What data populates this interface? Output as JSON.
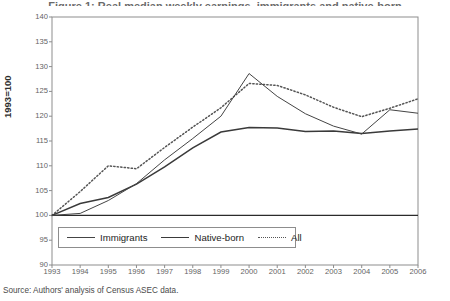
{
  "title_sliver": "Figure 1: Real median weekly earnings, immigrants and native-born",
  "source_note": "Source: Authors' analysis of Census ASEC data.",
  "legend": {
    "position": "inside-bottom-left",
    "entries": [
      {
        "label": "Immigrants",
        "style": "solid-thin",
        "swatch": "line-swatch-immigrants"
      },
      {
        "label": "Native-born",
        "style": "solid-thick",
        "swatch": "line-swatch-native-born"
      },
      {
        "label": "All",
        "style": "dotted",
        "swatch": "line-swatch-all"
      }
    ]
  },
  "axes": {
    "y_title": "1993=100",
    "y_ticks": [
      90,
      95,
      100,
      105,
      110,
      115,
      120,
      125,
      130,
      135,
      140
    ],
    "x_ticks": [
      1993,
      1994,
      1995,
      1996,
      1997,
      1998,
      1999,
      2000,
      2001,
      2002,
      2003,
      2004,
      2005,
      2006
    ]
  },
  "colors": {
    "immigrants": "#444444",
    "native_born": "#3a3a3a",
    "all": "#555555",
    "frame": "#8d8d8d",
    "baseline": "#2b2b2b",
    "text": "#3a3a3a",
    "tick_text": "#636363"
  },
  "chart_data": {
    "type": "line",
    "title": "Figure 1: Real median weekly earnings, immigrants and native-born",
    "subtitle": "",
    "xlabel": "",
    "ylabel": "1993=100",
    "xlim": [
      1993,
      2006
    ],
    "ylim": [
      90,
      140
    ],
    "ytick_step": 5,
    "grid": false,
    "legend_position": "inside-bottom-left",
    "annotations": [
      "baseline at 100"
    ],
    "x": [
      1993,
      1994,
      1995,
      1996,
      1997,
      1998,
      1999,
      2000,
      2001,
      2002,
      2003,
      2004,
      2005,
      2006
    ],
    "series": [
      {
        "name": "Immigrants",
        "style": "solid-thin",
        "values": [
          100.0,
          100.4,
          103.0,
          106.4,
          111.2,
          115.5,
          120.0,
          128.6,
          124.0,
          120.5,
          118.0,
          116.4,
          121.3,
          120.6
        ]
      },
      {
        "name": "Native-born",
        "style": "solid-thick",
        "values": [
          100.0,
          102.4,
          103.6,
          106.3,
          109.8,
          113.6,
          116.8,
          117.7,
          117.6,
          116.9,
          117.0,
          116.5,
          117.0,
          117.4
        ]
      },
      {
        "name": "All",
        "style": "dotted",
        "values": [
          100.0,
          104.8,
          110.0,
          109.4,
          113.7,
          117.8,
          121.7,
          126.6,
          126.2,
          124.3,
          121.8,
          119.9,
          121.6,
          123.5
        ]
      }
    ]
  }
}
